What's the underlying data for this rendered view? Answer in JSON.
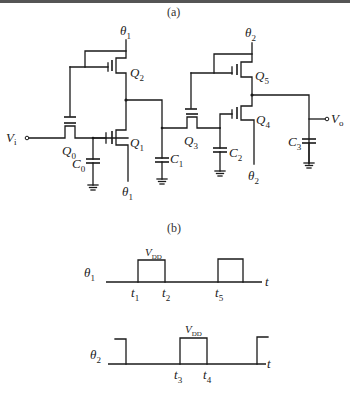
{
  "figure": {
    "panel_a_label": "(a)",
    "panel_b_label": "(b)"
  },
  "circuit": {
    "input_label": "V",
    "input_sub": "i",
    "output_label": "V",
    "output_sub": "o",
    "clock1_label": "θ",
    "clock1_sub": "1",
    "clock2_label": "θ",
    "clock2_sub": "2",
    "transistors": [
      {
        "name": "Q",
        "sub": "0"
      },
      {
        "name": "Q",
        "sub": "1"
      },
      {
        "name": "Q",
        "sub": "2"
      },
      {
        "name": "Q",
        "sub": "3"
      },
      {
        "name": "Q",
        "sub": "4"
      },
      {
        "name": "Q",
        "sub": "5"
      }
    ],
    "capacitors": [
      {
        "name": "C",
        "sub": "0"
      },
      {
        "name": "C",
        "sub": "1"
      },
      {
        "name": "C",
        "sub": "2"
      },
      {
        "name": "C",
        "sub": "3"
      }
    ]
  },
  "timing": {
    "theta1": {
      "label": "θ",
      "sub": "1",
      "high_label": "V",
      "high_sub": "DD",
      "axis": "t",
      "times": [
        {
          "name": "t",
          "sub": "1"
        },
        {
          "name": "t",
          "sub": "2"
        },
        {
          "name": "t",
          "sub": "5"
        }
      ]
    },
    "theta2": {
      "label": "θ",
      "sub": "2",
      "high_label": "V",
      "high_sub": "DD",
      "axis": "t",
      "times": [
        {
          "name": "t",
          "sub": "3"
        },
        {
          "name": "t",
          "sub": "4"
        }
      ]
    }
  }
}
